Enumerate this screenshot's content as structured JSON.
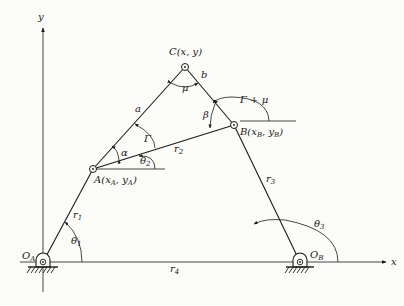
{
  "diagram": {
    "axes": {
      "x_label": "x",
      "y_label": "y"
    },
    "points": {
      "C": {
        "name": "C",
        "coords": "(x, y)"
      },
      "B": {
        "name": "B",
        "coords_open": "(x",
        "coords_sub1": "B",
        "coords_mid": ", y",
        "coords_sub2": "B",
        "coords_close": ")"
      },
      "A": {
        "name": "A",
        "coords_open": "(x",
        "coords_sub1": "A",
        "coords_mid": ", y",
        "coords_sub2": "A",
        "coords_close": ")"
      },
      "OA": {
        "main": "O",
        "sub": "A"
      },
      "OB": {
        "main": "O",
        "sub": "B"
      }
    },
    "links": {
      "a": "a",
      "b": "b",
      "r1": {
        "main": "r",
        "sub": "1"
      },
      "r2": {
        "main": "r",
        "sub": "2"
      },
      "r3": {
        "main": "r",
        "sub": "3"
      },
      "r4": {
        "main": "r",
        "sub": "4"
      }
    },
    "angles": {
      "mu": "μ",
      "beta": "β",
      "gamma_plus_mu": "Γ + μ",
      "gamma": "Γ",
      "alpha": "α",
      "theta1": {
        "main": "θ",
        "sub": "1"
      },
      "theta2": {
        "main": "θ",
        "sub": "2"
      },
      "theta3": {
        "main": "θ",
        "sub": "3"
      }
    },
    "colors": {
      "ink": "#1a1a1a",
      "paper": "#fbfbf8"
    }
  }
}
